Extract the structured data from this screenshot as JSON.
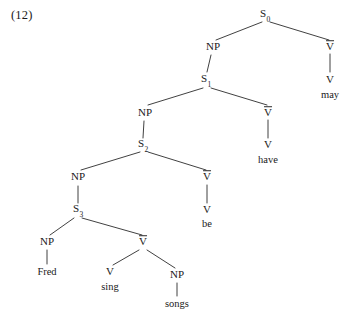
{
  "figure": {
    "example_number": "(12)",
    "sentence_words": [
      "Fred",
      "may",
      "have",
      "be",
      "sing",
      "songs"
    ],
    "ink_color": "#2b2b2b",
    "background_color": "#ffffff"
  },
  "nodes": {
    "s0": {
      "label": "S",
      "subscript": "0",
      "x": 265,
      "y": 15
    },
    "np0": {
      "label": "NP",
      "subscript": "",
      "x": 213,
      "y": 47
    },
    "vbar0": {
      "label": "V",
      "subscript": "",
      "x": 330,
      "y": 47
    },
    "v_may": {
      "label": "V",
      "subscript": "",
      "x": 330,
      "y": 80
    },
    "word_may": {
      "label": "may",
      "x": 330,
      "y": 94
    },
    "s1": {
      "label": "S",
      "subscript": "1",
      "x": 206,
      "y": 80
    },
    "np1": {
      "label": "NP",
      "subscript": "",
      "x": 145,
      "y": 113
    },
    "vbar1": {
      "label": "V",
      "subscript": "",
      "x": 268,
      "y": 113
    },
    "v_have": {
      "label": "V",
      "subscript": "",
      "x": 268,
      "y": 145
    },
    "word_have": {
      "label": "have",
      "x": 268,
      "y": 159
    },
    "s2": {
      "label": "S",
      "subscript": "2",
      "x": 143,
      "y": 145
    },
    "np2": {
      "label": "NP",
      "subscript": "",
      "x": 78,
      "y": 177
    },
    "vbar2": {
      "label": "V",
      "subscript": "",
      "x": 207,
      "y": 177
    },
    "v_be": {
      "label": "V",
      "subscript": "",
      "x": 207,
      "y": 210
    },
    "word_be": {
      "label": "be",
      "x": 207,
      "y": 223
    },
    "s3": {
      "label": "S",
      "subscript": "3",
      "x": 78,
      "y": 210
    },
    "np3": {
      "label": "NP",
      "subscript": "",
      "x": 47,
      "y": 242
    },
    "word_fred": {
      "label": "Fred",
      "x": 47,
      "y": 271
    },
    "vbar3": {
      "label": "V",
      "subscript": "",
      "x": 143,
      "y": 242
    },
    "v_sing": {
      "label": "V",
      "subscript": "",
      "x": 110,
      "y": 272
    },
    "word_sing": {
      "label": "sing",
      "x": 110,
      "y": 286
    },
    "np4": {
      "label": "NP",
      "subscript": "",
      "x": 177,
      "y": 275
    },
    "word_songs": {
      "label": "songs",
      "x": 177,
      "y": 303
    }
  },
  "edges": [
    {
      "name": "s0-np0",
      "x1": 262,
      "y1": 22,
      "x2": 216,
      "y2": 40
    },
    {
      "name": "s0-vbar0",
      "x1": 270,
      "y1": 22,
      "x2": 329,
      "y2": 40
    },
    {
      "name": "vbar0-v",
      "x1": 330,
      "y1": 54,
      "x2": 330,
      "y2": 72
    },
    {
      "name": "np0-s1",
      "x1": 211,
      "y1": 55,
      "x2": 207,
      "y2": 72
    },
    {
      "name": "s1-np1",
      "x1": 203,
      "y1": 88,
      "x2": 148,
      "y2": 105
    },
    {
      "name": "s1-vbar1",
      "x1": 211,
      "y1": 88,
      "x2": 267,
      "y2": 105
    },
    {
      "name": "vbar1-v",
      "x1": 268,
      "y1": 120,
      "x2": 268,
      "y2": 138
    },
    {
      "name": "np1-s2",
      "x1": 144,
      "y1": 121,
      "x2": 143,
      "y2": 138
    },
    {
      "name": "s2-np2",
      "x1": 140,
      "y1": 152,
      "x2": 81,
      "y2": 170
    },
    {
      "name": "s2-vbar2",
      "x1": 148,
      "y1": 152,
      "x2": 206,
      "y2": 170
    },
    {
      "name": "vbar2-v",
      "x1": 207,
      "y1": 185,
      "x2": 207,
      "y2": 203
    },
    {
      "name": "np2-s3",
      "x1": 78,
      "y1": 186,
      "x2": 78,
      "y2": 203
    },
    {
      "name": "s3-np3",
      "x1": 74,
      "y1": 218,
      "x2": 50,
      "y2": 235
    },
    {
      "name": "s3-vbar3",
      "x1": 82,
      "y1": 218,
      "x2": 142,
      "y2": 235
    },
    {
      "name": "np3-fred",
      "x1": 47,
      "y1": 250,
      "x2": 47,
      "y2": 264
    },
    {
      "name": "vbar3-vsing",
      "x1": 139,
      "y1": 250,
      "x2": 113,
      "y2": 265
    },
    {
      "name": "vbar3-np4",
      "x1": 147,
      "y1": 250,
      "x2": 175,
      "y2": 268
    },
    {
      "name": "np4-songs",
      "x1": 177,
      "y1": 283,
      "x2": 177,
      "y2": 296
    }
  ]
}
